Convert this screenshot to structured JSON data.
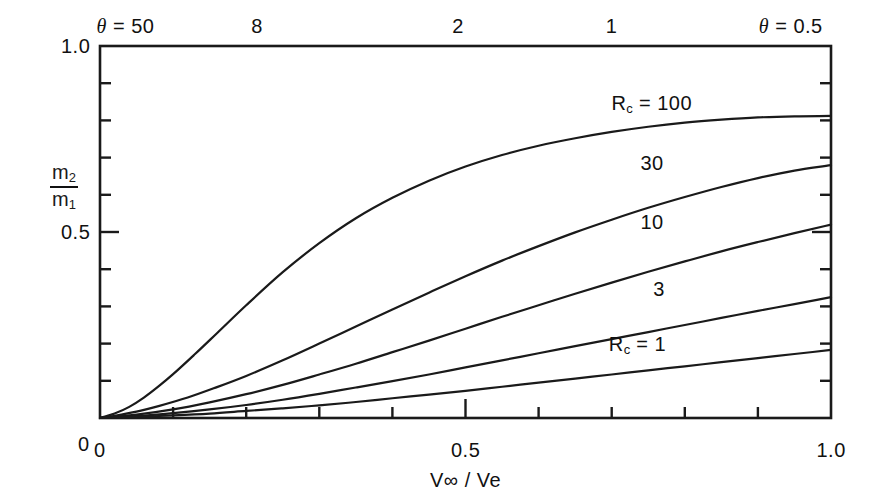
{
  "chart_data": {
    "type": "line",
    "title": "",
    "xlabel": "V∞ / Ve",
    "ylabel": "m2/m1",
    "ylabel_numerator": "m",
    "ylabel_numerator_sub": "2",
    "ylabel_denominator": "m",
    "ylabel_denominator_sub": "1",
    "xlim": [
      0,
      1.0
    ],
    "ylim": [
      0,
      1.0
    ],
    "grid": false,
    "legend_position": "inline-curve-labels",
    "x_tick_labels": [
      "0",
      "0.5",
      "1.0"
    ],
    "x_tick_values": [
      0,
      0.5,
      1.0
    ],
    "x_minor_tick_step": 0.1,
    "y_tick_labels": [
      "0",
      "0.5",
      "1.0"
    ],
    "y_tick_values": [
      0,
      0.5,
      1.0
    ],
    "y_minor_tick_step": 0.1,
    "top_axis": {
      "symbol": "θ",
      "labels": [
        {
          "text": "θ = 50",
          "x": 0.035
        },
        {
          "text": "8",
          "x": 0.215
        },
        {
          "text": "2",
          "x": 0.49
        },
        {
          "text": "1",
          "x": 0.7
        },
        {
          "text": "θ = 0.5",
          "x": 0.945
        }
      ]
    },
    "series": [
      {
        "name": "Rc = 100",
        "label_text": "R_c = 100",
        "label_prefix": "R",
        "label_sub": "c",
        "label_suffix": " = 100",
        "label_x": 0.755,
        "label_y": 0.845,
        "x": [
          0,
          0.02,
          0.04,
          0.06,
          0.08,
          0.1,
          0.13,
          0.16,
          0.2,
          0.25,
          0.3,
          0.35,
          0.4,
          0.45,
          0.5,
          0.55,
          0.6,
          0.65,
          0.7,
          0.75,
          0.8,
          0.85,
          0.9,
          0.95,
          1.0
        ],
        "y": [
          0,
          0.012,
          0.03,
          0.055,
          0.085,
          0.118,
          0.172,
          0.228,
          0.303,
          0.392,
          0.47,
          0.537,
          0.592,
          0.638,
          0.676,
          0.707,
          0.732,
          0.752,
          0.769,
          0.783,
          0.794,
          0.802,
          0.808,
          0.811,
          0.812
        ]
      },
      {
        "name": "30",
        "label_text": "30",
        "label_x": 0.755,
        "label_y": 0.685,
        "x": [
          0,
          0.02,
          0.05,
          0.08,
          0.12,
          0.16,
          0.2,
          0.25,
          0.3,
          0.35,
          0.4,
          0.45,
          0.5,
          0.55,
          0.6,
          0.65,
          0.7,
          0.75,
          0.8,
          0.85,
          0.9,
          0.95,
          1.0
        ],
        "y": [
          0,
          0.006,
          0.017,
          0.032,
          0.055,
          0.083,
          0.113,
          0.155,
          0.2,
          0.246,
          0.292,
          0.337,
          0.381,
          0.423,
          0.462,
          0.499,
          0.533,
          0.565,
          0.594,
          0.621,
          0.645,
          0.665,
          0.68
        ]
      },
      {
        "name": "10",
        "label_text": "10",
        "label_x": 0.755,
        "label_y": 0.525,
        "x": [
          0,
          0.05,
          0.1,
          0.15,
          0.2,
          0.25,
          0.3,
          0.35,
          0.4,
          0.45,
          0.5,
          0.55,
          0.6,
          0.65,
          0.7,
          0.75,
          0.8,
          0.85,
          0.9,
          0.95,
          1.0
        ],
        "y": [
          0,
          0.009,
          0.023,
          0.042,
          0.064,
          0.089,
          0.117,
          0.146,
          0.177,
          0.208,
          0.24,
          0.272,
          0.303,
          0.334,
          0.364,
          0.393,
          0.421,
          0.448,
          0.473,
          0.497,
          0.52
        ]
      },
      {
        "name": "3",
        "label_text": "3",
        "label_x": 0.765,
        "label_y": 0.345,
        "x": [
          0,
          0.05,
          0.1,
          0.15,
          0.2,
          0.25,
          0.3,
          0.35,
          0.4,
          0.45,
          0.5,
          0.55,
          0.6,
          0.65,
          0.7,
          0.75,
          0.8,
          0.85,
          0.9,
          0.95,
          1.0
        ],
        "y": [
          0,
          0.005,
          0.013,
          0.023,
          0.035,
          0.049,
          0.065,
          0.082,
          0.099,
          0.117,
          0.136,
          0.155,
          0.174,
          0.193,
          0.212,
          0.231,
          0.25,
          0.269,
          0.288,
          0.306,
          0.325
        ]
      },
      {
        "name": "Rc = 1",
        "label_text": "R_c = 1",
        "label_prefix": "R",
        "label_sub": "c",
        "label_suffix": " = 1",
        "label_x": 0.735,
        "label_y": 0.195,
        "x": [
          0,
          0.05,
          0.1,
          0.15,
          0.2,
          0.25,
          0.3,
          0.35,
          0.4,
          0.45,
          0.5,
          0.55,
          0.6,
          0.65,
          0.7,
          0.75,
          0.8,
          0.85,
          0.9,
          0.95,
          1.0
        ],
        "y": [
          0,
          0.003,
          0.007,
          0.012,
          0.019,
          0.026,
          0.034,
          0.043,
          0.053,
          0.063,
          0.073,
          0.084,
          0.095,
          0.106,
          0.117,
          0.128,
          0.139,
          0.15,
          0.161,
          0.172,
          0.183
        ]
      }
    ],
    "line_color": "#1a1a1a",
    "axis_color": "#1a1a1a",
    "background_color": "#ffffff"
  },
  "axes": {
    "x_labels": [
      {
        "text": "0",
        "x": 0
      },
      {
        "text": "0.5",
        "x": 0.5
      },
      {
        "text": "1.0",
        "x": 1.0
      }
    ],
    "y_labels": [
      {
        "text": "0",
        "y": 0
      },
      {
        "text": "0.5",
        "y": 0.5
      },
      {
        "text": "1.0",
        "y": 1.0
      }
    ],
    "x_title": "V∞ / Ve",
    "top_title_left": "θ = 50",
    "top_title_right": "θ = 0.5"
  }
}
